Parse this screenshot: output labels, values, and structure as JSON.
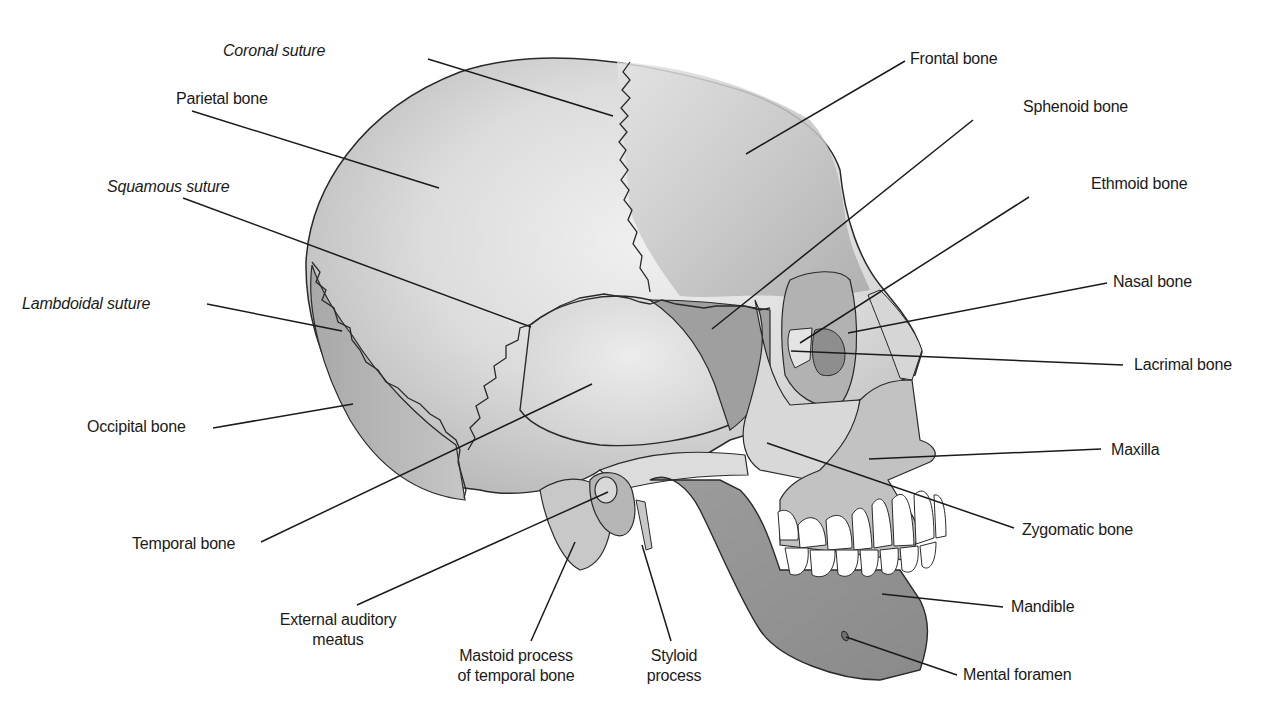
{
  "figure": {
    "colors": {
      "background": "#ffffff",
      "bone_light": "#e2e2e2",
      "bone_mid": "#c4c4c4",
      "bone_dark": "#9a9a9a",
      "outline": "#2a2a2a",
      "leader": "#1a1a1a",
      "teeth": "#ffffff"
    }
  },
  "labels": {
    "coronal_suture": {
      "text": "Coronal suture",
      "style": "italic",
      "x": 223,
      "y": 50,
      "align": "left",
      "line": [
        428,
        59,
        613,
        116
      ]
    },
    "parietal_bone": {
      "text": "Parietal bone",
      "style": "normal",
      "x": 176,
      "y": 91,
      "align": "left",
      "line": [
        192,
        111,
        439,
        188
      ]
    },
    "squamous_suture": {
      "text": "Squamous suture",
      "style": "italic",
      "x": 107,
      "y": 178,
      "align": "left",
      "line": [
        183,
        198,
        531,
        327
      ]
    },
    "lambdoidal_suture": {
      "text": "Lambdoidal suture",
      "style": "italic",
      "x": 22,
      "y": 294,
      "align": "left",
      "line": [
        207,
        304,
        342,
        331
      ]
    },
    "occipital_bone": {
      "text": "Occipital bone",
      "style": "normal",
      "x": 87,
      "y": 418,
      "align": "left",
      "line": [
        213,
        428,
        353,
        404
      ]
    },
    "temporal_bone": {
      "text": "Temporal bone",
      "style": "normal",
      "x": 132,
      "y": 535,
      "align": "left",
      "line": [
        261,
        542,
        592,
        384
      ]
    },
    "external_auditory_meatus": {
      "text": "External auditory",
      "text2": "meatus",
      "style": "normal",
      "x": 338,
      "y": 611,
      "align": "center",
      "line": [
        357,
        605,
        608,
        492
      ]
    },
    "mastoid_process": {
      "text": "Mastoid process",
      "text2": "of temporal bone",
      "style": "normal",
      "x": 516,
      "y": 647,
      "align": "center",
      "line": [
        531,
        641,
        575,
        542
      ]
    },
    "styloid_process": {
      "text": "Styloid",
      "text2": "process",
      "style": "normal",
      "x": 674,
      "y": 647,
      "align": "center",
      "line": [
        671,
        641,
        642,
        545
      ]
    },
    "frontal_bone": {
      "text": "Frontal bone",
      "style": "normal",
      "x": 910,
      "y": 50,
      "align": "left",
      "line": [
        905,
        61,
        746,
        154
      ]
    },
    "sphenoid_bone": {
      "text": "Sphenoid bone",
      "style": "normal",
      "x": 1023,
      "y": 97,
      "align": "left",
      "line": [
        973,
        120,
        712,
        329
      ]
    },
    "ethmoid_bone": {
      "text": "Ethmoid bone",
      "style": "normal",
      "x": 1091,
      "y": 174,
      "align": "left",
      "line": [
        1029,
        197,
        800,
        343
      ]
    },
    "nasal_bone": {
      "text": "Nasal bone",
      "style": "normal",
      "x": 1113,
      "y": 272,
      "align": "left",
      "line": [
        1107,
        283,
        848,
        333
      ]
    },
    "lacrimal_bone": {
      "text": "Lacrimal bone",
      "style": "normal",
      "x": 1134,
      "y": 356,
      "align": "left",
      "line": [
        1123,
        365,
        791,
        351
      ]
    },
    "maxilla": {
      "text": "Maxilla",
      "style": "normal",
      "x": 1111,
      "y": 442,
      "align": "left",
      "line": [
        1101,
        449,
        869,
        459
      ]
    },
    "zygomatic_bone": {
      "text": "Zygomatic bone",
      "style": "normal",
      "x": 1022,
      "y": 521,
      "align": "left",
      "line": [
        1014,
        528,
        767,
        443
      ]
    },
    "mandible": {
      "text": "Mandible",
      "style": "normal",
      "x": 1011,
      "y": 597,
      "align": "left",
      "line": [
        1003,
        607,
        882,
        594
      ]
    },
    "mental_foramen": {
      "text": "Mental foramen",
      "style": "normal",
      "x": 963,
      "y": 665,
      "align": "left",
      "line": [
        957,
        675,
        846,
        637
      ]
    }
  }
}
